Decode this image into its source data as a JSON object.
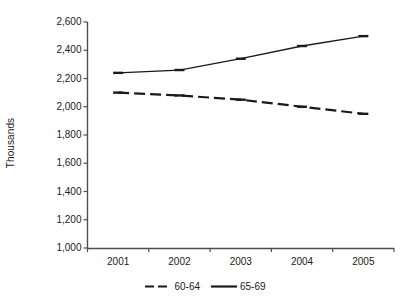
{
  "chart_data": {
    "type": "line",
    "title": "",
    "subtitle": "",
    "xlabel": "",
    "ylabel": "Thousands",
    "categories": [
      "2001",
      "2002",
      "2003",
      "2004",
      "2005"
    ],
    "x": [
      2001,
      2002,
      2003,
      2004,
      2005
    ],
    "series": [
      {
        "name": "60-64",
        "style": "dashed",
        "color": "#1a1a1a",
        "values": [
          2100,
          2080,
          2050,
          2000,
          1950
        ]
      },
      {
        "name": "65-69",
        "style": "solid",
        "color": "#1a1a1a",
        "values": [
          2240,
          2260,
          2340,
          2430,
          2500
        ]
      }
    ],
    "ylim": [
      1000,
      2600
    ],
    "ytick_step": 200,
    "ytick_labels": [
      "2,600",
      "2,400",
      "2,200",
      "2,000",
      "1,800",
      "1,600",
      "1,400",
      "1,200",
      "1,000"
    ],
    "ytick_values": [
      2600,
      2400,
      2200,
      2000,
      1800,
      1600,
      1400,
      1200,
      1000
    ],
    "grid": false,
    "legend_position": "bottom",
    "axis_color": "#4d4d4d",
    "background": "#ffffff"
  },
  "axes": {
    "y_title": "Thousands",
    "y_ticks": [
      {
        "label": "2,600"
      },
      {
        "label": "2,400"
      },
      {
        "label": "2,200"
      },
      {
        "label": "2,000"
      },
      {
        "label": "1,800"
      },
      {
        "label": "1,600"
      },
      {
        "label": "1,400"
      },
      {
        "label": "1,200"
      },
      {
        "label": "1,000"
      }
    ],
    "x_ticks": [
      {
        "label": "2001"
      },
      {
        "label": "2002"
      },
      {
        "label": "2003"
      },
      {
        "label": "2004"
      },
      {
        "label": "2005"
      }
    ]
  },
  "legend": {
    "items": [
      {
        "label": "60-64",
        "style": "dashed"
      },
      {
        "label": "65-69",
        "style": "solid"
      }
    ]
  }
}
